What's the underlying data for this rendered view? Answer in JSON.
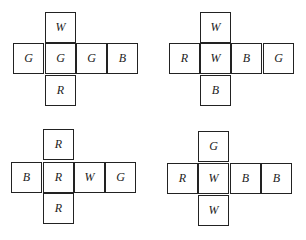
{
  "nets": [
    {
      "id": "net-1",
      "top": "W",
      "row": [
        "G",
        "G",
        "G",
        "B"
      ],
      "bottom": "R"
    },
    {
      "id": "net-2",
      "top": "W",
      "row": [
        "R",
        "W",
        "B",
        "G"
      ],
      "bottom": "B"
    },
    {
      "id": "net-3",
      "top": "R",
      "row": [
        "B",
        "R",
        "W",
        "G"
      ],
      "bottom": "R"
    },
    {
      "id": "net-4",
      "top": "G",
      "row": [
        "R",
        "W",
        "B",
        "B"
      ],
      "bottom": "W"
    }
  ]
}
